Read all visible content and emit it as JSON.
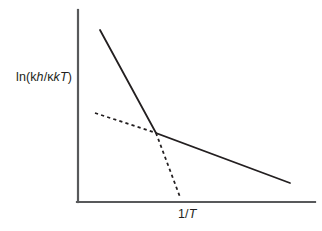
{
  "figure": {
    "background_color": "#ffffff",
    "axis_color": "#58595b",
    "series_color": "#231f20"
  },
  "labels": {
    "y_axis_text": "ln(kh/κkT)",
    "y_axis_parts": {
      "prefix": "ln(",
      "k_roman": "k",
      "h_italic": "h",
      "slash": "/",
      "kappa": "κ",
      "k_italic": "k",
      "T_italic": "T",
      "suffix": ")"
    },
    "x_axis_text": "1/T",
    "x_axis_parts": {
      "one_over": "1/",
      "T_italic": "T"
    }
  },
  "chart_data": {
    "type": "line",
    "title": "",
    "xlabel": "1/T",
    "ylabel": "ln(kh/κkT)",
    "xlim": [
      0,
      1
    ],
    "ylim": [
      0,
      1
    ],
    "grid": false,
    "legend": "none",
    "axes": {
      "x_axis_pixels": {
        "x1": 78,
        "y1": 202,
        "x2": 315,
        "y2": 202
      },
      "y_axis_pixels": {
        "x1": 78,
        "y1": 10,
        "x2": 78,
        "y2": 202
      },
      "ticks": [],
      "tick_labels": []
    },
    "annotations": [],
    "series": [
      {
        "name": "solid-bilinear",
        "style": "solid",
        "color": "#231f20",
        "points_pixels": [
          [
            100,
            30
          ],
          [
            156,
            133
          ],
          [
            290,
            183
          ]
        ],
        "segments": [
          {
            "name": "steep-low-temperature-branch",
            "from": [
              100,
              30
            ],
            "to": [
              156,
              133
            ],
            "slope_sign": "negative-steep"
          },
          {
            "name": "shallow-high-temperature-branch",
            "from": [
              156,
              133
            ],
            "to": [
              290,
              183
            ],
            "slope_sign": "negative-shallow"
          }
        ]
      },
      {
        "name": "dashed-bilinear",
        "style": "dashed",
        "color": "#231f20",
        "dash_pattern": [
          3.2,
          3.2
        ],
        "points_pixels": [
          [
            95,
            113
          ],
          [
            156,
            133
          ],
          [
            180,
            197
          ]
        ],
        "segments": [
          {
            "name": "shallow-branch",
            "from": [
              95,
              113
            ],
            "to": [
              156,
              133
            ],
            "slope_sign": "negative-shallow"
          },
          {
            "name": "steep-branch",
            "from": [
              156,
              133
            ],
            "to": [
              180,
              197
            ],
            "slope_sign": "negative-steep"
          }
        ]
      }
    ],
    "intersection_pixels": [
      156,
      133
    ]
  }
}
